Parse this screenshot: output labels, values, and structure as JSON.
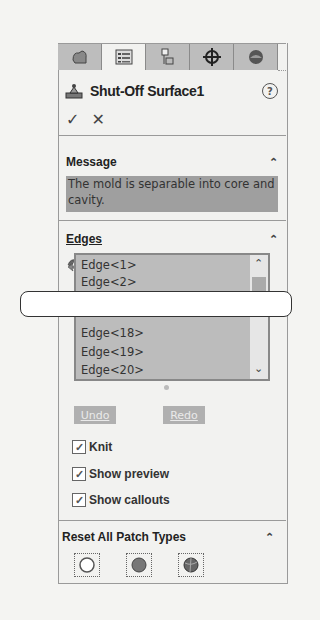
{
  "tabs": [
    {
      "icon": "feature-manager-icon"
    },
    {
      "icon": "property-manager-icon",
      "active": true
    },
    {
      "icon": "configuration-manager-icon"
    },
    {
      "icon": "dimxpert-icon"
    },
    {
      "icon": "display-manager-icon"
    }
  ],
  "header": {
    "title": "Shut-Off Surface1",
    "help": "?",
    "ok": "✓",
    "cancel": "✕"
  },
  "message": {
    "heading": "Message",
    "text": "The mold is separable into core and cavity."
  },
  "edges": {
    "heading": "Edges",
    "items_top": [
      "Edge<1>",
      "Edge<2>"
    ],
    "items_bottom": [
      "Edge<18>",
      "Edge<19>",
      "Edge<20>"
    ],
    "undo": "Undo",
    "redo": "Redo"
  },
  "options": [
    {
      "label": "Knit",
      "checked": true
    },
    {
      "label": "Show preview",
      "checked": true
    },
    {
      "label": "Show callouts",
      "checked": true
    }
  ],
  "reset": {
    "heading": "Reset All Patch Types",
    "buttons": [
      "no-fill-patch-icon",
      "contact-patch-icon",
      "tangent-patch-icon"
    ]
  }
}
